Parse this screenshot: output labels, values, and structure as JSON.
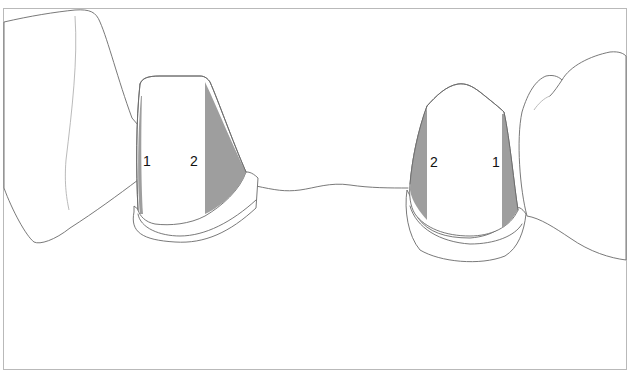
{
  "figure": {
    "colors": {
      "outline": "#6a6a6a",
      "shade": "#9e9e9e",
      "frame": "#b9b9b9",
      "background": "#ffffff"
    },
    "left_preparation": {
      "labels": [
        {
          "id": "surface-1",
          "text": "1"
        },
        {
          "id": "surface-2",
          "text": "2"
        }
      ]
    },
    "right_preparation": {
      "labels": [
        {
          "id": "surface-2",
          "text": "2"
        },
        {
          "id": "surface-1",
          "text": "1"
        }
      ]
    }
  }
}
